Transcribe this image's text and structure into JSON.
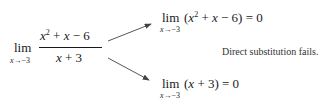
{
  "figure": {
    "left": {
      "lim": "lim",
      "subscript_var": "x",
      "subscript_arrow": "→",
      "subscript_val": "−3",
      "numerator": {
        "x": "x",
        "exp": "2",
        "rest1": " + ",
        "x2": "x",
        "rest2": " − 6"
      },
      "denominator": {
        "x": "x",
        "rest": " + 3"
      }
    },
    "top": {
      "lim": "lim",
      "subscript_var": "x",
      "subscript_arrow": "→",
      "subscript_val": "−3",
      "open": "(",
      "x": "x",
      "exp": "2",
      "mid": " + ",
      "x2": "x",
      "rest": " − 6) = 0"
    },
    "bottom": {
      "lim": "lim",
      "subscript_var": "x",
      "subscript_arrow": "→",
      "subscript_val": "−3",
      "open": "(",
      "x": "x",
      "rest": " + 3) = 0"
    },
    "note": "Direct substitution fails.",
    "arrow_color": "#444444"
  }
}
